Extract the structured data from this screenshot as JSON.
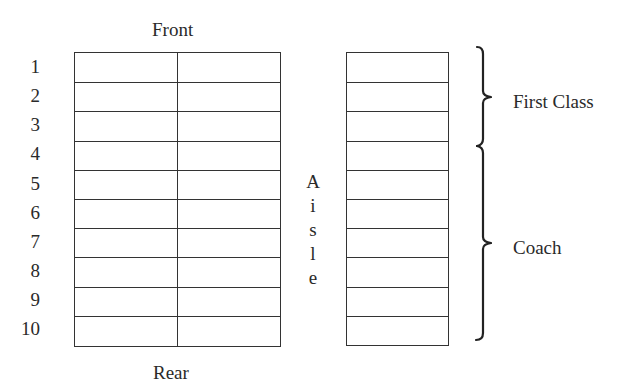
{
  "diagram": {
    "title_top": "Front",
    "title_bottom": "Rear",
    "aisle_letters": [
      "A",
      "i",
      "s",
      "l",
      "e"
    ],
    "rows": [
      "1",
      "2",
      "3",
      "4",
      "5",
      "6",
      "7",
      "8",
      "9",
      "10"
    ],
    "left_section": {
      "columns": 2,
      "rows": 10
    },
    "right_section": {
      "columns": 1,
      "rows": 10
    },
    "groups": [
      {
        "label": "First Class",
        "rows_from": 1,
        "rows_to": 3
      },
      {
        "label": "Coach",
        "rows_from": 4,
        "rows_to": 10
      }
    ],
    "line_color": "#333333"
  }
}
